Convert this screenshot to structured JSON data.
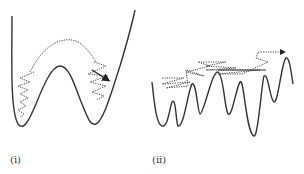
{
  "figure": {
    "panels": [
      {
        "id": "i",
        "label": "(i)",
        "description": "Double-well energy landscape with dotted trajectory hopping over a single barrier between two minima"
      },
      {
        "id": "ii",
        "label": "(ii)",
        "description": "Rugged multi-well energy landscape with dotted trajectory zigzagging across many barriers, ending in an arrow pointing right"
      }
    ],
    "colors": {
      "curve": "#333333",
      "trajectory": "#444444",
      "background": "#ffffff"
    }
  }
}
